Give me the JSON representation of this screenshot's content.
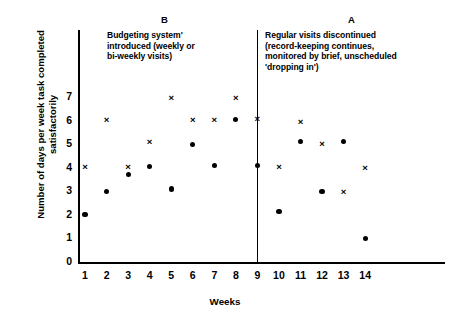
{
  "chart_data": {
    "type": "scatter",
    "title": "",
    "xlabel": "Weeks",
    "ylabel": "Number of days per week task completed satisfactorily",
    "x": [
      1,
      2,
      3,
      4,
      5,
      6,
      7,
      8,
      9,
      10,
      11,
      12,
      13,
      14
    ],
    "xlim": [
      0.4,
      14.6
    ],
    "ylim": [
      0,
      7.5
    ],
    "xticks": [
      "1",
      "2",
      "3",
      "4",
      "5",
      "6",
      "7",
      "8",
      "9",
      "10",
      "11",
      "12",
      "13",
      "14"
    ],
    "yticks": [
      "0",
      "1",
      "2",
      "3",
      "4",
      "5",
      "6",
      "7"
    ],
    "grid": false,
    "legend": "none",
    "series": [
      {
        "name": "cross-series",
        "marker": "x",
        "points": [
          {
            "x": 1,
            "y": 4.05
          },
          {
            "x": 2,
            "y": 6.05
          },
          {
            "x": 3,
            "y": 4.05
          },
          {
            "x": 4,
            "y": 5.1
          },
          {
            "x": 5,
            "y": 7.0
          },
          {
            "x": 6,
            "y": 6.05
          },
          {
            "x": 7,
            "y": 6.05
          },
          {
            "x": 8,
            "y": 7.0
          },
          {
            "x": 9,
            "y": 6.1
          },
          {
            "x": 10,
            "y": 4.05
          },
          {
            "x": 11,
            "y": 5.95
          },
          {
            "x": 12,
            "y": 5.05
          },
          {
            "x": 13,
            "y": 3.0
          },
          {
            "x": 14,
            "y": 4.0
          }
        ]
      },
      {
        "name": "dot-series",
        "marker": "filled-circle",
        "points": [
          {
            "x": 1,
            "y": 2.0
          },
          {
            "x": 2,
            "y": 3.0
          },
          {
            "x": 3,
            "y": 3.72
          },
          {
            "x": 4,
            "y": 4.05
          },
          {
            "x": 5,
            "y": 3.1
          },
          {
            "x": 6,
            "y": 5.0
          },
          {
            "x": 7,
            "y": 4.1
          },
          {
            "x": 8,
            "y": 6.05
          },
          {
            "x": 9,
            "y": 4.1
          },
          {
            "x": 10,
            "y": 2.15
          },
          {
            "x": 11,
            "y": 5.1
          },
          {
            "x": 12,
            "y": 3.0
          },
          {
            "x": 13,
            "y": 5.1
          },
          {
            "x": 14,
            "y": 1.0
          }
        ]
      }
    ],
    "phase_divider_x": 8.75,
    "annotations": [
      {
        "id": "phase-b",
        "letter": "B",
        "text": "Budgeting system' introduced (weekly or bi-weekly visits)",
        "lines": [
          "Budgeting system'",
          "introduced (weekly or",
          "bi-weekly visits)"
        ]
      },
      {
        "id": "phase-a",
        "letter": "A",
        "text": "Regular visits discontinued (record-keeping continues, monitored by brief, unscheduled 'dropping in')",
        "lines": [
          "Regular visits discontinued",
          "(record-keeping continues,",
          "monitored by brief, unscheduled",
          "'dropping in')"
        ]
      }
    ],
    "colors": {
      "axis": "#000000",
      "marker": "#000000",
      "background": "#ffffff"
    }
  }
}
